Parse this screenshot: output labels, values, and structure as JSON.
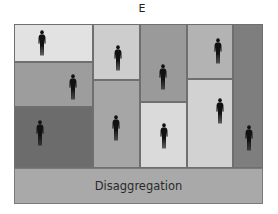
{
  "title": "E",
  "footer_label": "Disaggregation",
  "colors": {
    "light": "#e2e2e2",
    "light_mid": "#c9c9c9",
    "mid": "#a8a8a8",
    "mid_dark": "#999999",
    "dark": "#6b6b6b",
    "darker": "#808080",
    "bar": "#a9a9a9",
    "figure": "#111111"
  },
  "cells": [
    {
      "id": "c1r1",
      "x": 14,
      "y": 24,
      "w": 79,
      "h": 38,
      "shade": "#e2e2e2"
    },
    {
      "id": "c1r2",
      "x": 14,
      "y": 62,
      "w": 79,
      "h": 45,
      "shade": "#9d9d9d"
    },
    {
      "id": "c1r3",
      "x": 14,
      "y": 107,
      "w": 79,
      "h": 61,
      "shade": "#6c6c6c"
    },
    {
      "id": "c2r1",
      "x": 93,
      "y": 24,
      "w": 47,
      "h": 56,
      "shade": "#cdcdcd"
    },
    {
      "id": "c2r2",
      "x": 93,
      "y": 80,
      "w": 47,
      "h": 88,
      "shade": "#a6a6a6"
    },
    {
      "id": "c3r1",
      "x": 140,
      "y": 24,
      "w": 47,
      "h": 78,
      "shade": "#9a9a9a"
    },
    {
      "id": "c3r2",
      "x": 140,
      "y": 102,
      "w": 47,
      "h": 66,
      "shade": "#dadada"
    },
    {
      "id": "c4r1",
      "x": 187,
      "y": 24,
      "w": 46,
      "h": 55,
      "shade": "#b3b3b3"
    },
    {
      "id": "c4r2",
      "x": 187,
      "y": 79,
      "w": 46,
      "h": 89,
      "shade": "#d2d2d2"
    },
    {
      "id": "c5",
      "x": 233,
      "y": 24,
      "w": 30,
      "h": 144,
      "shade": "#7e7e7e"
    }
  ],
  "figures": [
    {
      "x": 42,
      "y": 43
    },
    {
      "x": 73,
      "y": 87
    },
    {
      "x": 40,
      "y": 133
    },
    {
      "x": 118,
      "y": 58
    },
    {
      "x": 116,
      "y": 128
    },
    {
      "x": 163,
      "y": 77
    },
    {
      "x": 164,
      "y": 136
    },
    {
      "x": 218,
      "y": 51
    },
    {
      "x": 220,
      "y": 111
    },
    {
      "x": 249,
      "y": 138
    }
  ]
}
